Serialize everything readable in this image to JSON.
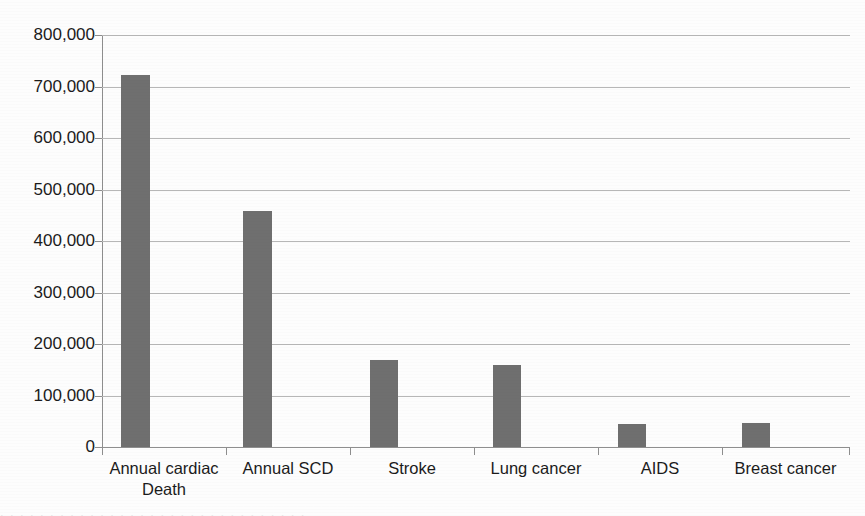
{
  "chart_data": {
    "type": "bar",
    "title": "",
    "xlabel": "",
    "ylabel": "",
    "categories": [
      "Annual cardiac\nDeath",
      "Annual SCD",
      "Stroke",
      "Lung cancer",
      "AIDS",
      "Breast cancer"
    ],
    "values": [
      723000,
      458000,
      169000,
      159000,
      45000,
      46000
    ],
    "ylim": [
      0,
      800000
    ],
    "ytick_labels": [
      "0",
      "100,000",
      "200,000",
      "300,000",
      "400,000",
      "500,000",
      "600,000",
      "700,000",
      "800,000"
    ],
    "ytick_values": [
      0,
      100000,
      200000,
      300000,
      400000,
      500000,
      600000,
      700000,
      800000
    ],
    "grid": true,
    "legend": false,
    "bar_color": "#6f6f6f",
    "grid_color": "#b7b7b7",
    "axis_color": "#8e8e8e",
    "text_color": "#1b1b1b",
    "background_color": "#fdfdfd"
  },
  "footer": {
    "partial_caption": ". .  .  .  .  . .  .  .  .  .  .  .  .  .  .  . .  .  .  .  .  .  .  .  . .  .  .  .  ."
  }
}
